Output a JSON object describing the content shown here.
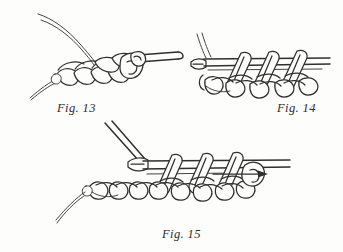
{
  "page": {
    "background_color": "#fdfdfc",
    "ink_color": "#2f2f2f",
    "width": 343,
    "height": 252
  },
  "figures": [
    {
      "id": "fig-13",
      "caption": "Fig. 13",
      "caption_x": 57,
      "caption_y": 101,
      "description": "Crochet hook drawn through a chain of stitches with two yarn strands curving up to the left",
      "elements": [
        "yarn-strand-upper",
        "yarn-strand-lower",
        "chain-stitch-row",
        "crochet-hook",
        "working-loop",
        "yarn-tail"
      ]
    },
    {
      "id": "fig-14",
      "caption": "Fig. 14",
      "caption_x": 277,
      "caption_y": 101,
      "description": "Three double crochet posts worked over horizontal yarn bars with hook tip entering at the left",
      "elements": [
        "hook-tip",
        "yarn-bar-upper",
        "yarn-bar-lower",
        "stitch-post-1",
        "stitch-post-2",
        "stitch-post-3",
        "chain-stitch-row"
      ]
    },
    {
      "id": "fig-15",
      "caption": "Fig. 15",
      "caption_x": 162,
      "caption_y": 227,
      "description": "Completed row of stitches with hook entering from upper left and a directional arrow pointing right",
      "elements": [
        "crochet-hook-shaft",
        "hook-tip",
        "yarn-bar-upper",
        "yarn-bar-lower",
        "stitch-post-1",
        "stitch-post-2",
        "stitch-post-3",
        "chain-stitch-row",
        "yarn-tail",
        "direction-arrow"
      ]
    }
  ],
  "annotations": {
    "arrow_direction": "right",
    "arrow_label": ""
  }
}
